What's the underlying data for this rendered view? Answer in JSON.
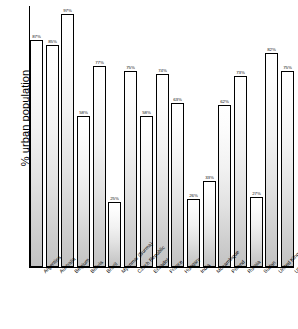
{
  "chart_data": {
    "type": "bar",
    "title": "",
    "subtitle": "",
    "xlabel": "",
    "ylabel": "% urban population",
    "ylim": [
      0,
      100
    ],
    "grid": false,
    "legend": null,
    "value_suffix": "%",
    "categories": [
      "Argentina",
      "Australia",
      "Belgium",
      "Bolivia",
      "Brazil",
      "Myanmar (Burma)",
      "Czech Republic",
      "Ecuador",
      "France",
      "Hungary",
      "India",
      "Mozambique",
      "Poland",
      "Russia",
      "Sudan",
      "United Kingdom",
      "USA"
    ],
    "values": [
      87,
      85,
      97,
      58,
      77,
      25,
      75,
      58,
      74,
      63,
      26,
      33,
      62,
      73,
      27,
      82,
      75
    ],
    "value_labels": [
      "87%",
      "85%",
      "97%",
      "58%",
      "77%",
      "25%",
      "75%",
      "58%",
      "74%",
      "63%",
      "26%",
      "33%",
      "62%",
      "73%",
      "27%",
      "82%",
      "75%"
    ],
    "bar_style": {
      "fill": "#e8e8e8",
      "gradient_top": "#ffffff",
      "gradient_bottom": "#c2c2c2",
      "outline": "#000000"
    },
    "axis_color": "#000000",
    "background": "#ffffff"
  }
}
